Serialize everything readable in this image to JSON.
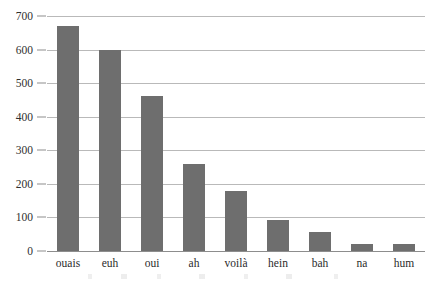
{
  "chart_data": {
    "type": "bar",
    "title": "",
    "subtitle": "",
    "xlabel": "",
    "ylabel": "",
    "categories": [
      "ouais",
      "euh",
      "oui",
      "ah",
      "voilà",
      "hein",
      "bah",
      "na",
      "hum"
    ],
    "values": [
      670,
      600,
      462,
      258,
      178,
      93,
      58,
      21,
      21
    ],
    "ylim": [
      0,
      700
    ],
    "yticks": [
      0,
      100,
      200,
      300,
      400,
      500,
      600,
      700
    ],
    "ytick_labels": [
      "0",
      "100",
      "200",
      "300",
      "400",
      "500",
      "600",
      "700"
    ],
    "grid": "horizontal",
    "legend": "none",
    "annotations": [],
    "colors": {
      "bar_fill": "#6e6e6e",
      "gridline": "#b9b9b9",
      "axis_line": "#8d8d8d",
      "text": "#2b2b2b",
      "background": "#ffffff"
    }
  }
}
